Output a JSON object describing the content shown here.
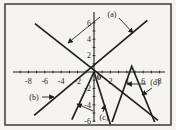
{
  "colors": {
    "ink": "#1f1f1f",
    "border": "#454545",
    "paper": "#f4f3ef"
  },
  "chart_data": {
    "type": "line",
    "title": "",
    "xlabel": "",
    "ylabel": "",
    "xlim": [
      -9.5,
      8.7
    ],
    "ylim": [
      -6.6,
      7.3
    ],
    "grid": false,
    "origin_label": "0",
    "axes": {
      "x_labeled_ticks": [
        -8,
        -6,
        -4,
        -2,
        2,
        4,
        6,
        8
      ],
      "x_tick_labels": [
        "-8",
        "-6",
        "-4",
        "-2",
        "2",
        "4",
        "6",
        "8"
      ],
      "y_labeled_ticks": [
        2,
        4,
        6,
        -2,
        -4,
        -6
      ],
      "y_tick_labels": [
        "2",
        "4",
        "6",
        "-2",
        "-4",
        "-6"
      ],
      "minor_tick_step": 1
    },
    "series": [
      {
        "id": "a-neg",
        "label": "(a)",
        "name": "line-negative-slope",
        "points": [
          [
            -7.2,
            5.9
          ],
          [
            7.8,
            -5.9
          ]
        ]
      },
      {
        "id": "a-pos",
        "label": "(a)",
        "name": "line-positive-slope",
        "points": [
          [
            -7.3,
            -5.3
          ],
          [
            6.5,
            6.3
          ]
        ]
      },
      {
        "id": "c-left",
        "label": "(c)",
        "name": "steep-line-down-left",
        "points": [
          [
            0,
            0
          ],
          [
            -2.7,
            -5.8
          ]
        ]
      },
      {
        "id": "c-right",
        "label": "(c)",
        "name": "steep-line-down-right",
        "points": [
          [
            0,
            0
          ],
          [
            2.0,
            -6.4
          ]
        ]
      },
      {
        "id": "d-tent",
        "label": "(d)",
        "name": "inverted-v-apex-near-5",
        "points": [
          [
            2.2,
            -6.1
          ],
          [
            4.6,
            0.7
          ],
          [
            7.4,
            -6.1
          ]
        ]
      }
    ],
    "annotations": [
      {
        "id": "a",
        "text": "(a)",
        "px": [
          112,
          14
        ],
        "arrows_px": [
          [
            100,
            17,
            68,
            43
          ],
          [
            119,
            18,
            133,
            33
          ]
        ]
      },
      {
        "id": "b",
        "text": "(b)",
        "px": [
          34,
          97
        ],
        "arrows_px": [
          [
            42,
            97,
            54,
            97
          ]
        ]
      },
      {
        "id": "c",
        "text": "(c)",
        "px": [
          104,
          117
        ],
        "arrows_px": [
          [
            93,
            111,
            77,
            104
          ],
          [
            103,
            112,
            105,
            105
          ]
        ]
      },
      {
        "id": "d",
        "text": "(d)",
        "px": [
          155,
          82
        ],
        "arrows_px": [
          [
            146,
            84,
            127,
            84
          ],
          [
            152,
            88,
            142,
            95
          ]
        ]
      }
    ]
  }
}
